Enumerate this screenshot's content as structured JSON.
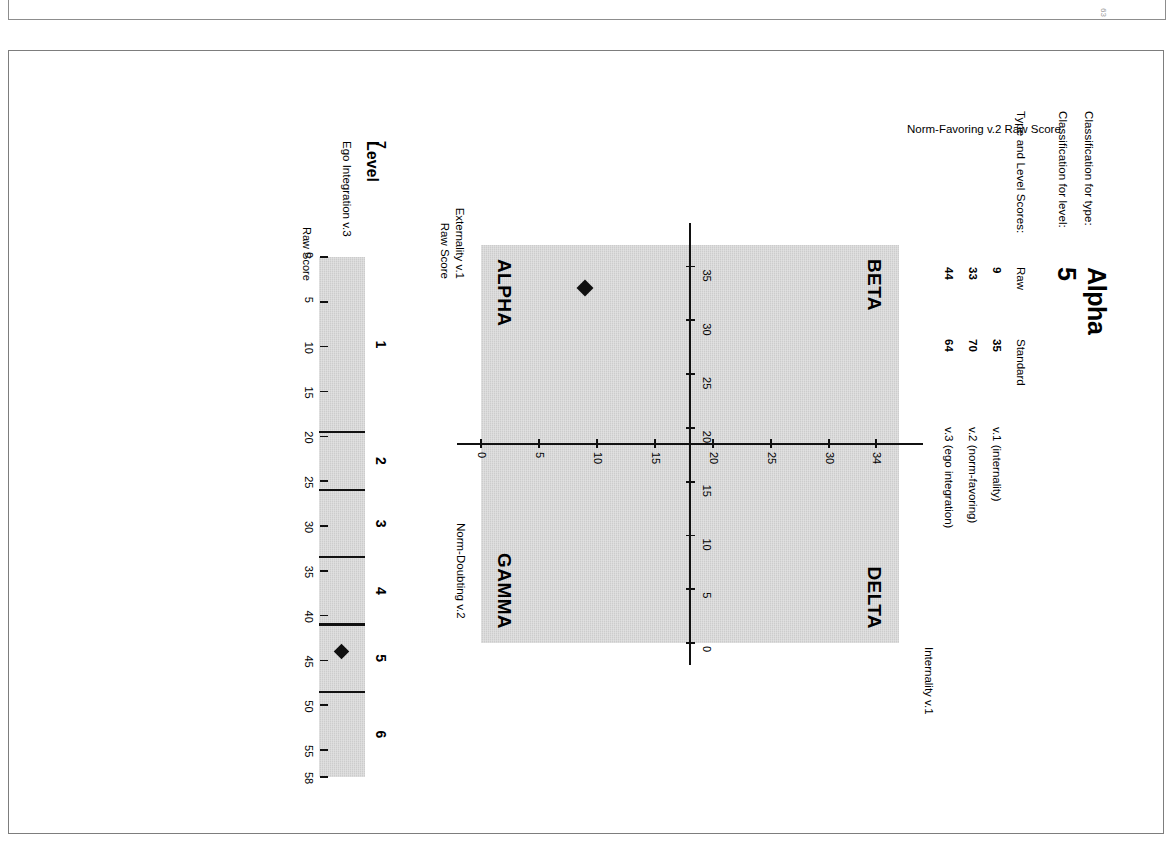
{
  "document": {
    "page_marker": "63"
  },
  "header": {
    "classification_type_label": "Classification for type:",
    "classification_type_value": "Alpha",
    "classification_level_label": "Classification for level:",
    "classification_level_value": "5",
    "scores_label": "Type and Level Scores:",
    "col_raw": "Raw",
    "col_standard": "Standard",
    "rows": [
      {
        "raw": "9",
        "standard": "35",
        "variable": "v.1 (internality)"
      },
      {
        "raw": "33",
        "standard": "70",
        "variable": "v.2 (norm-favoring)"
      },
      {
        "raw": "44",
        "standard": "64",
        "variable": "v.3 (ego integration)"
      }
    ]
  },
  "scatter": {
    "quadrants": {
      "top_left": "BETA",
      "top_right": "DELTA",
      "bottom_left": "ALPHA",
      "bottom_right": "GAMMA"
    },
    "y_axis_title_top": "Internality v.1",
    "y_axis_title_bottom_line1": "Externality v.1",
    "y_axis_title_bottom_line2": "Raw Score",
    "x_axis_title_left_line1": "Norm-Favoring v.2 Raw Score",
    "x_axis_title_right": "Norm-Doubting v.2",
    "x_ticks": [
      "35",
      "30",
      "25",
      "20",
      "15",
      "10",
      "5",
      "0"
    ],
    "y_ticks": [
      "0",
      "5",
      "10",
      "15",
      "20",
      "25",
      "30",
      "34"
    ]
  },
  "level": {
    "title": "Level",
    "subtitle": "Ego Integration v.3",
    "raw_score_label": "Raw Score",
    "bands": [
      "1",
      "2",
      "3",
      "4",
      "5",
      "6",
      "7"
    ],
    "ticks": [
      "0",
      "5",
      "10",
      "15",
      "20",
      "25",
      "30",
      "35",
      "40",
      "45",
      "50",
      "55",
      "58"
    ]
  },
  "chart_data": [
    {
      "type": "scatter",
      "title": "Type plot — Externality v.1 vs Norm-Favoring v.2",
      "xlabel": "Norm-Favoring v.2 Raw Score  /  Norm-Doubting v.2",
      "ylabel": "Externality v.1 Raw Score  /  Internality v.1",
      "xlim": [
        0,
        37
      ],
      "ylim": [
        0,
        36
      ],
      "x_reversed": true,
      "x_ticks": [
        35,
        30,
        25,
        20,
        15,
        10,
        5,
        0
      ],
      "y_ticks": [
        0,
        5,
        10,
        15,
        20,
        25,
        30,
        34
      ],
      "grid": false,
      "legend": "none",
      "quadrant_split": {
        "x": 20,
        "y": 17
      },
      "quadrant_labels": {
        "upper_left": "BETA",
        "upper_right": "DELTA",
        "lower_left": "ALPHA",
        "lower_right": "GAMMA"
      },
      "series": [
        {
          "name": "Respondent",
          "marker": "diamond",
          "color": "#101010",
          "points": [
            {
              "x": 33,
              "y": 9,
              "label": "v.2 raw 33, v.1 raw 9"
            }
          ]
        }
      ]
    },
    {
      "type": "bar",
      "subtype": "banded-scale",
      "title": "Ego Integration v.3 — Level",
      "xlabel": "Raw Score",
      "ylabel": "Level",
      "xlim": [
        0,
        58
      ],
      "x_ticks": [
        0,
        5,
        10,
        15,
        20,
        25,
        30,
        35,
        40,
        45,
        50,
        55,
        58
      ],
      "grid": false,
      "legend": "none",
      "categories": [
        "1",
        "2",
        "3",
        "4",
        "5",
        "6",
        "7"
      ],
      "band_boundaries": [
        0,
        19.5,
        26,
        33.5,
        41,
        48.5,
        58
      ],
      "band_centers": [
        10,
        23,
        30,
        37,
        45,
        53
      ],
      "value": 44,
      "marker": "diamond",
      "marker_color": "#101010"
    }
  ]
}
